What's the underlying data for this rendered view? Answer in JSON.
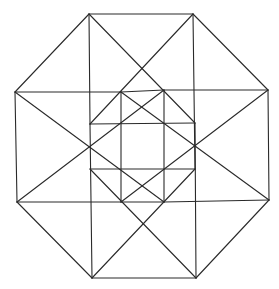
{
  "diagram": {
    "title": "",
    "stroke_color": "#2a2a2a",
    "background": "#ffffff",
    "vertices": {
      "T1": [
        89,
        14
      ],
      "T2": [
        193,
        14
      ],
      "R1": [
        268,
        90
      ],
      "R2": [
        269,
        200
      ],
      "B2": [
        196,
        278
      ],
      "B1": [
        92,
        278
      ],
      "L2": [
        17,
        202
      ],
      "L1": [
        15,
        92
      ],
      "A": [
        121,
        92
      ],
      "B": [
        164,
        90
      ],
      "C": [
        195,
        123
      ],
      "D": [
        195,
        169
      ],
      "E": [
        164,
        202
      ],
      "F": [
        121,
        202
      ],
      "G": [
        90,
        169
      ],
      "H": [
        90,
        124
      ]
    },
    "edges": [
      [
        "T1",
        "T2"
      ],
      [
        "T2",
        "R1"
      ],
      [
        "R1",
        "R2"
      ],
      [
        "R2",
        "B2"
      ],
      [
        "B2",
        "B1"
      ],
      [
        "B1",
        "L2"
      ],
      [
        "L2",
        "L1"
      ],
      [
        "L1",
        "T1"
      ],
      [
        "L1",
        "A"
      ],
      [
        "B",
        "R1"
      ],
      [
        "L2",
        "F"
      ],
      [
        "E",
        "R2"
      ],
      [
        "T1",
        "H"
      ],
      [
        "T2",
        "D"
      ],
      [
        "B1",
        "H"
      ],
      [
        "B2",
        "C"
      ],
      [
        "T1",
        "C"
      ],
      [
        "T2",
        "H"
      ],
      [
        "B1",
        "D"
      ],
      [
        "B2",
        "G"
      ],
      [
        "L1",
        "E"
      ],
      [
        "R1",
        "F"
      ],
      [
        "L2",
        "B"
      ],
      [
        "R2",
        "A"
      ],
      [
        "A",
        "F"
      ],
      [
        "B",
        "E"
      ],
      [
        "H",
        "C"
      ],
      [
        "G",
        "D"
      ],
      [
        "A",
        "B"
      ],
      [
        "F",
        "E"
      ]
    ]
  }
}
